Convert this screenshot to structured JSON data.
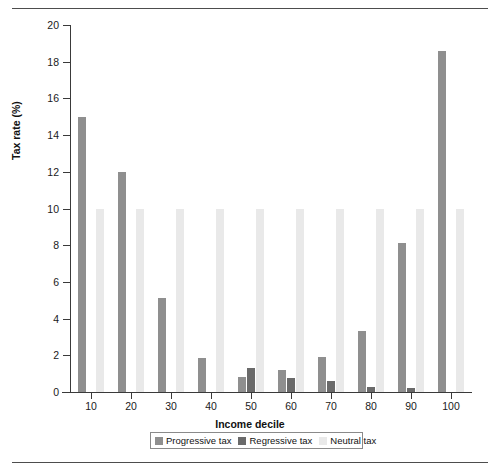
{
  "chart_data": {
    "type": "bar",
    "title": "",
    "xlabel": "Income decile",
    "ylabel": "Tax rate (%)",
    "categories": [
      "10",
      "20",
      "30",
      "40",
      "50",
      "60",
      "70",
      "80",
      "90",
      "100"
    ],
    "ylim": [
      0,
      20
    ],
    "yticks": [
      0,
      2,
      4,
      6,
      8,
      10,
      12,
      14,
      16,
      18,
      20
    ],
    "ytick_labels": [
      "0",
      "2",
      "4",
      "6",
      "8",
      "10",
      "12",
      "14",
      "16",
      "18",
      "20"
    ],
    "grid": false,
    "legend_position": "bottom-center",
    "series": [
      {
        "name": "Progressive tax",
        "color": "#8f8f8f",
        "values": [
          15.0,
          12.0,
          5.1,
          1.85,
          0.8,
          1.2,
          1.9,
          3.3,
          8.1,
          18.6
        ]
      },
      {
        "name": "Regressive tax",
        "color": "#6a6a6a",
        "values": [
          0,
          0,
          0,
          0,
          1.3,
          0.75,
          0.6,
          0.3,
          0.2,
          0
        ]
      },
      {
        "name": "Neutral tax",
        "color": "#e9e9e9",
        "values": [
          10,
          10,
          10,
          10,
          10,
          10,
          10,
          10,
          10,
          10
        ]
      }
    ]
  },
  "legend": {
    "items": [
      {
        "label": "Progressive tax",
        "color": "#8f8f8f"
      },
      {
        "label": "Regressive tax",
        "color": "#6a6a6a"
      },
      {
        "label": "Neutral tax",
        "color": "#e9e9e9"
      }
    ]
  }
}
